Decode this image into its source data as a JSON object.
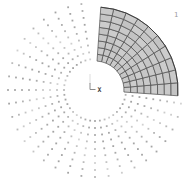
{
  "window_label": "1",
  "triad": {
    "x_label": "X",
    "axis_color": "#8a8a8a",
    "faint_axis_color": "#cfcfcf"
  },
  "figure": {
    "center_x": 95,
    "center_y": 90,
    "mesh": {
      "inner_radius": 29,
      "outer_radius": 83,
      "start_angle_deg": -4,
      "end_angle_deg": 86,
      "radial_divisions": 8,
      "angular_divisions": 10,
      "element_fills": [
        "#cccccc",
        "#c6c6c6",
        "#c9c9c9",
        "#c3c3c3"
      ],
      "edge_color": "#4a4a4a",
      "boundary_color": "#3c3c3c"
    },
    "nodes": {
      "line_count": 29,
      "start_angle_deg": 99,
      "angle_step_deg": 9,
      "dots_per_line": 9,
      "inner_radius": 31,
      "radius_step": 7,
      "dot_size": 1.8,
      "dot_color": "#9e9e9e"
    }
  }
}
